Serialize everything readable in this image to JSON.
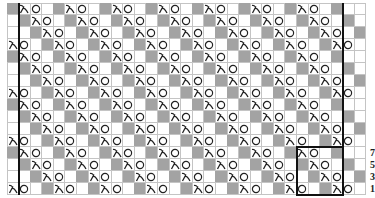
{
  "chart": {
    "columns": 31,
    "rows": 16,
    "cell_width": 11.58,
    "cell_height": 12,
    "repeat": {
      "cols_start": 25,
      "cols_end": 28,
      "rows_start": 12,
      "rows_end": 15,
      "width": 4,
      "height": 4
    },
    "thick_lines_after_columns": [
      0,
      28
    ],
    "symbols": {
      "gray": "no-stitch",
      "white": "knit",
      "lambda": "k2tog / decrease",
      "O": "yarn-over"
    },
    "colors": {
      "gray": "#a3a3a3",
      "grid": "#c4c4c4",
      "border": "#111111",
      "symbol": "#222222"
    },
    "row_labels": [
      {
        "row": 12,
        "label": "7"
      },
      {
        "row": 13,
        "label": "5"
      },
      {
        "row": 14,
        "label": "3"
      },
      {
        "row": 15,
        "label": "1"
      }
    ]
  }
}
